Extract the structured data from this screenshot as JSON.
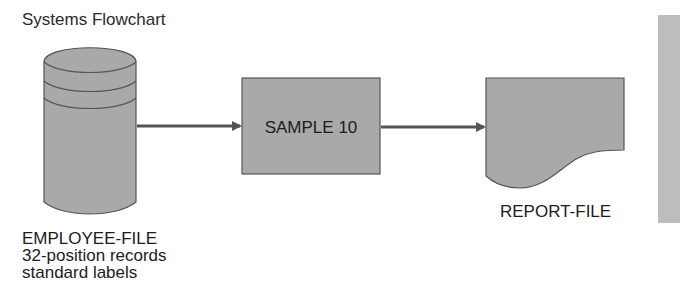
{
  "title": "Systems Flowchart",
  "nodes": {
    "input_file": {
      "shape": "disk-cylinder",
      "name": "EMPLOYEE-FILE",
      "details": [
        "32-position records",
        "standard labels"
      ]
    },
    "process": {
      "shape": "rectangle",
      "label": "SAMPLE 10"
    },
    "output_file": {
      "shape": "document",
      "name": "REPORT-FILE"
    }
  },
  "edges": [
    {
      "from": "EMPLOYEE-FILE",
      "to": "SAMPLE 10"
    },
    {
      "from": "SAMPLE 10",
      "to": "REPORT-FILE"
    }
  ],
  "colors": {
    "shape_fill": "#a9a9a9",
    "shape_stroke": "#555555",
    "arrow": "#555555",
    "side_bar": "#bdbdbd"
  }
}
